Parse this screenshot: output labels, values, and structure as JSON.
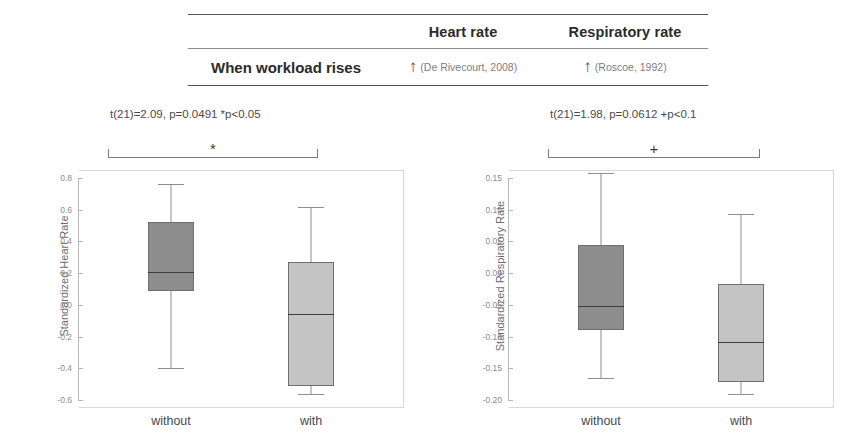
{
  "table": {
    "columns": [
      "",
      "Heart rate",
      "Respiratory rate"
    ],
    "row_label": "When  workload rises",
    "heart": {
      "arrow": "↑",
      "citation": "(De Rivecourt, 2008)"
    },
    "resp": {
      "arrow": "↑",
      "citation": "(Roscoe, 1992)"
    }
  },
  "panels": {
    "heart": {
      "stats": "t(21)=2.09, p=0.0491 *p<0.05",
      "significance_marker": "*"
    },
    "resp": {
      "stats": "t(21)=1.98, p=0.0612 +p<0.1",
      "significance_marker": "+"
    }
  },
  "chart_data": [
    {
      "type": "box",
      "title": "",
      "ylabel": "Standardized Heart Rate",
      "xlabel": "",
      "categories": [
        "without",
        "with"
      ],
      "ylim": [
        -0.6,
        0.8
      ],
      "yticks": [
        0.8,
        0.6,
        0.4,
        0.2,
        0.0,
        -0.2,
        -0.4,
        -0.6
      ],
      "ytick_labels": [
        "0.8",
        "0.6",
        "0.4",
        "0.2",
        "0.0",
        "-0.2",
        "-0.4",
        "-0.6"
      ],
      "grid": false,
      "legend": "none",
      "boxes": [
        {
          "category": "without",
          "whisker_high": 0.76,
          "q3": 0.52,
          "median": 0.21,
          "q1": 0.09,
          "whisker_low": -0.4,
          "fill": "#8d8d8d"
        },
        {
          "category": "with",
          "whisker_high": 0.62,
          "q3": 0.27,
          "median": -0.06,
          "q1": -0.51,
          "whisker_low": -0.56,
          "fill": "#c4c4c4"
        }
      ]
    },
    {
      "type": "box",
      "title": "",
      "ylabel": "Standardized Respiratory Rate",
      "xlabel": "",
      "categories": [
        "without",
        "with"
      ],
      "ylim": [
        -0.2,
        0.15
      ],
      "yticks": [
        0.15,
        0.1,
        0.05,
        0.0,
        -0.05,
        -0.1,
        -0.15,
        -0.2
      ],
      "ytick_labels": [
        "0.15",
        "0.10",
        "0.05",
        "0.00",
        "-0.05",
        "-0.10",
        "-0.15",
        "-0.20"
      ],
      "grid": false,
      "legend": "none",
      "boxes": [
        {
          "category": "without",
          "whisker_high": 0.158,
          "q3": 0.045,
          "median": -0.052,
          "q1": -0.09,
          "whisker_low": -0.166,
          "fill": "#8d8d8d"
        },
        {
          "category": "with",
          "whisker_high": 0.093,
          "q3": -0.017,
          "median": -0.108,
          "q1": -0.172,
          "whisker_low": -0.19,
          "fill": "#c4c4c4"
        }
      ]
    }
  ]
}
